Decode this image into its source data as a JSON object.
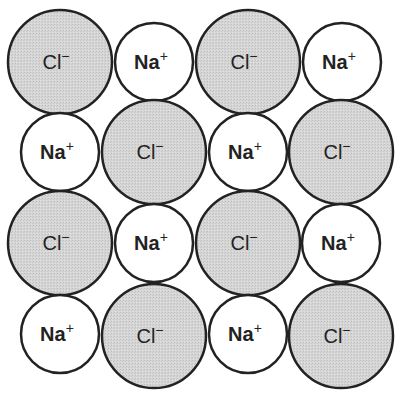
{
  "diagram": {
    "colors": {
      "cl_fill": "#d3d3d3",
      "na_fill": "#ffffff",
      "stroke": "#222222",
      "text": "#222222"
    },
    "ions": [
      {
        "row": 1,
        "col": 1,
        "type": "cl",
        "symbol": "Cl",
        "charge": "−",
        "cx": 60,
        "cy": 62,
        "r": 52
      },
      {
        "row": 1,
        "col": 2,
        "type": "na",
        "symbol": "Na",
        "charge": "+",
        "cx": 154,
        "cy": 62,
        "r": 39
      },
      {
        "row": 1,
        "col": 3,
        "type": "cl",
        "symbol": "Cl",
        "charge": "−",
        "cx": 248,
        "cy": 62,
        "r": 52
      },
      {
        "row": 1,
        "col": 4,
        "type": "na",
        "symbol": "Na",
        "charge": "+",
        "cx": 342,
        "cy": 62,
        "r": 39
      },
      {
        "row": 2,
        "col": 1,
        "type": "na",
        "symbol": "Na",
        "charge": "+",
        "cx": 60,
        "cy": 152,
        "r": 39
      },
      {
        "row": 2,
        "col": 2,
        "type": "cl",
        "symbol": "Cl",
        "charge": "−",
        "cx": 154,
        "cy": 152,
        "r": 52
      },
      {
        "row": 2,
        "col": 3,
        "type": "na",
        "symbol": "Na",
        "charge": "+",
        "cx": 248,
        "cy": 152,
        "r": 39
      },
      {
        "row": 2,
        "col": 4,
        "type": "cl",
        "symbol": "Cl",
        "charge": "−",
        "cx": 341,
        "cy": 152,
        "r": 52
      },
      {
        "row": 3,
        "col": 1,
        "type": "cl",
        "symbol": "Cl",
        "charge": "−",
        "cx": 60,
        "cy": 243,
        "r": 52
      },
      {
        "row": 3,
        "col": 2,
        "type": "na",
        "symbol": "Na",
        "charge": "+",
        "cx": 154,
        "cy": 243,
        "r": 39
      },
      {
        "row": 3,
        "col": 3,
        "type": "cl",
        "symbol": "Cl",
        "charge": "−",
        "cx": 248,
        "cy": 243,
        "r": 52
      },
      {
        "row": 3,
        "col": 4,
        "type": "na",
        "symbol": "Na",
        "charge": "+",
        "cx": 341,
        "cy": 243,
        "r": 39
      },
      {
        "row": 4,
        "col": 1,
        "type": "na",
        "symbol": "Na",
        "charge": "+",
        "cx": 60,
        "cy": 334,
        "r": 39
      },
      {
        "row": 4,
        "col": 2,
        "type": "cl",
        "symbol": "Cl",
        "charge": "−",
        "cx": 154,
        "cy": 336,
        "r": 52
      },
      {
        "row": 4,
        "col": 3,
        "type": "na",
        "symbol": "Na",
        "charge": "+",
        "cx": 248,
        "cy": 334,
        "r": 39
      },
      {
        "row": 4,
        "col": 4,
        "type": "cl",
        "symbol": "Cl",
        "charge": "−",
        "cx": 341,
        "cy": 336,
        "r": 52
      }
    ]
  }
}
